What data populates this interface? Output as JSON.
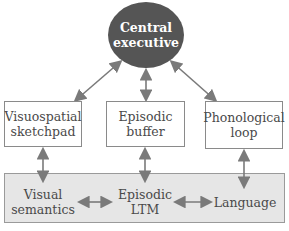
{
  "diagram": {
    "top": {
      "line1": "Central",
      "line2": "executive"
    },
    "middle": [
      {
        "line1": "Visuospatial",
        "line2": "sketchpad"
      },
      {
        "line1": "Episodic",
        "line2": "buffer"
      },
      {
        "line1": "Phonological",
        "line2": "loop"
      }
    ],
    "bottom": [
      {
        "line1": "Visual",
        "line2": "semantics"
      },
      {
        "line1": "Episodic",
        "line2": "LTM"
      },
      {
        "line1": "Language",
        "line2": ""
      }
    ],
    "colors": {
      "executive_fill": "#555555",
      "arrow": "#7a7a7a",
      "band_fill": "#e6e6e6"
    }
  }
}
